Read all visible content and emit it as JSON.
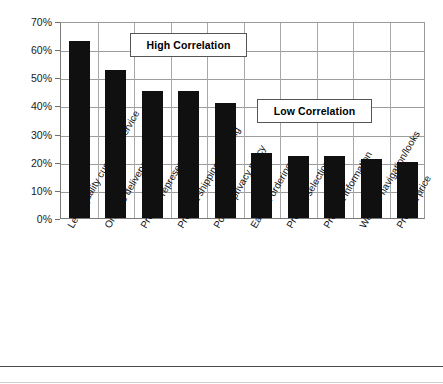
{
  "chart_data": {
    "type": "bar",
    "title": "",
    "subtitle": "",
    "xlabel": "",
    "ylabel": "",
    "ylim": [
      0,
      70
    ],
    "ytick_labels": [
      "70%",
      "60%",
      "50%",
      "40%",
      "30%",
      "20%",
      "10%",
      "0%"
    ],
    "ytick_values": [
      70,
      60,
      50,
      40,
      30,
      20,
      10,
      0
    ],
    "grid": true,
    "legend": "none",
    "bar_color": "#101010",
    "categories": [
      "Level/quality customer service",
      "On-time delivery",
      "Product representation",
      "Product shipping/handling",
      "Posted privacy policy",
      "Ease of ordering",
      "Product selection",
      "Product information",
      "Website navigation/looks",
      "Product price"
    ],
    "values": [
      63,
      52.5,
      45,
      45,
      41,
      23,
      22,
      22,
      21,
      20
    ],
    "annotations": [
      {
        "name": "high-correlation-callout",
        "text": "High Correlation"
      },
      {
        "name": "low-correlation-callout",
        "text": "Low Correlation"
      }
    ]
  }
}
